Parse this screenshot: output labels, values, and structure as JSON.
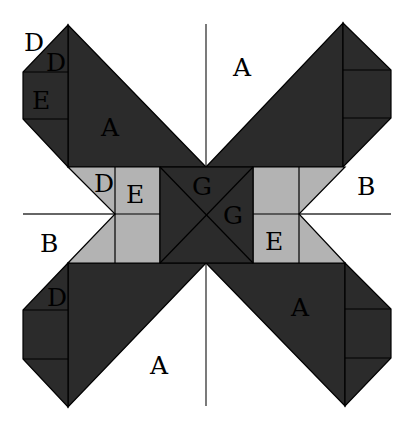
{
  "diagram": {
    "type": "quilt-block-template",
    "colors": {
      "dark": "#2b2b2b",
      "light": "#b3b3b3",
      "background": "#ffffff",
      "outline": "#000000"
    },
    "labels": {
      "top_left_outer_D": "D",
      "top_left_inner_D": "D",
      "top_left_E": "E",
      "top_left_A": "A",
      "top_right_A": "A",
      "left_gray_D": "D",
      "left_gray_E": "E",
      "center_G_top": "G",
      "center_G_right": "G",
      "right_B": "B",
      "left_B": "B",
      "right_gray_E": "E",
      "bottom_left_D": "D",
      "bottom_right_A": "A",
      "bottom_left_A": "A"
    }
  }
}
